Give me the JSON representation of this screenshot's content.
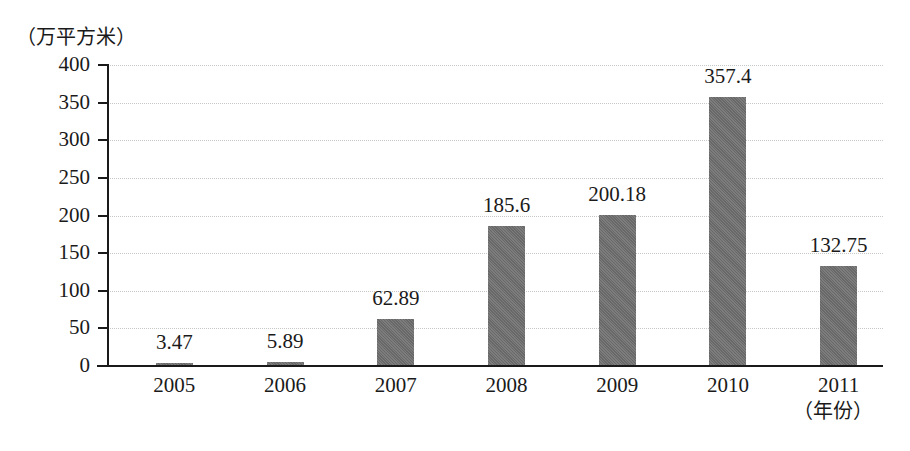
{
  "chart_data": {
    "type": "bar",
    "title": "",
    "subtitle": "",
    "xlabel": "（年份）",
    "ylabel": "（万平方米）",
    "categories": [
      "2005",
      "2006",
      "2007",
      "2008",
      "2009",
      "2010",
      "2011"
    ],
    "values": [
      3.47,
      5.89,
      62.89,
      185.6,
      200.18,
      357.4,
      132.75
    ],
    "value_labels": [
      "3.47",
      "5.89",
      "62.89",
      "185.6",
      "200.18",
      "357.4",
      "132.75"
    ],
    "series": [
      {
        "name": "",
        "values": [
          3.47,
          5.89,
          62.89,
          185.6,
          200.18,
          357.4,
          132.75
        ]
      }
    ],
    "ylim": [
      0,
      400
    ],
    "ytick_values": [
      0,
      50,
      100,
      150,
      200,
      250,
      300,
      350,
      400
    ],
    "ytick_labels": [
      "0",
      "50",
      "100",
      "150",
      "200",
      "250",
      "300",
      "350",
      "400"
    ],
    "grid": true,
    "grid_axis": "y",
    "legend": false,
    "legend_position": "none",
    "bar_color": "#6e6e6e",
    "axis_color": "#1a1a1a",
    "gridline_color": "#c8c8c8",
    "background_color": "#ffffff"
  }
}
